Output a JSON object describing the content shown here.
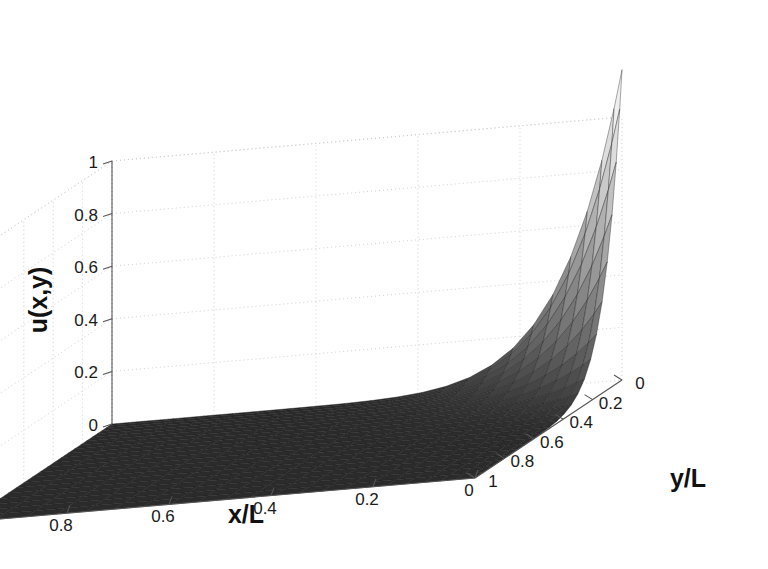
{
  "figure": {
    "kind": "surface-plot",
    "background_color": "#ffffff"
  },
  "chart_data": {
    "type": "heatmap",
    "render_style": "3d-surface-mesh",
    "title": "",
    "subtitle": "",
    "xlabel": "x/L",
    "ylabel": "y/L",
    "zlabel": "u(x,y)",
    "colormap": "gray",
    "colormap_low_color": "#2b2b2b",
    "colormap_high_color": "#efefef",
    "mesh_color": "#1d1d1d",
    "grid": true,
    "gridline_color": "#c9c9d2",
    "legend": "none",
    "xlim": [
      0,
      1
    ],
    "ylim": [
      0,
      1
    ],
    "zlim": [
      0,
      1
    ],
    "x_ticks": [
      1,
      0.8,
      0.6,
      0.4,
      0.2,
      0
    ],
    "x_tick_labels": [
      "1",
      "0.8",
      "0.6",
      "0.4",
      "0.2",
      "0"
    ],
    "y_ticks": [
      0,
      0.2,
      0.4,
      0.6,
      0.8,
      1
    ],
    "y_tick_labels": [
      "0",
      "0.2",
      "0.4",
      "0.6",
      "0.8",
      "1"
    ],
    "z_ticks": [
      0,
      0.2,
      0.4,
      0.6,
      0.8,
      1
    ],
    "z_tick_labels": [
      "0",
      "0.2",
      "0.4",
      "0.6",
      "0.8",
      "1"
    ],
    "x_axis_direction": "descending-left-to-right",
    "y_axis_direction": "descending-right-to-left-at-front",
    "peak": {
      "x": 0,
      "y": 0,
      "z": 1.18,
      "description": "singular corner peak exceeding z=1 at origin corner (x/L=0, y/L=0)"
    },
    "surface_description": "u(x,y) is near zero over most of the domain and rises sharply to a sharp singular spike at the corner x/L=0, y/L=0; corner-singularity solution of a Laplace / diffusion problem on a unit square",
    "surface_formula": "u = ((1-x)^2 * (1-y)^2) ^ 4.2, scaled so u(0,0) = 1.18",
    "n_grid": 22,
    "z_samples_along_diagonal": {
      "t": [
        0,
        0.1,
        0.2,
        0.3,
        0.4,
        0.5,
        0.6,
        0.7,
        0.8,
        0.9,
        1.0
      ],
      "u": [
        1.18,
        0.48,
        0.2,
        0.09,
        0.04,
        0.016,
        0.006,
        0.002,
        0.001,
        0.0002,
        0.0
      ]
    }
  },
  "axes": {
    "z_title": "u(x,y)",
    "x_title": "x/L",
    "y_title": "y/L"
  }
}
